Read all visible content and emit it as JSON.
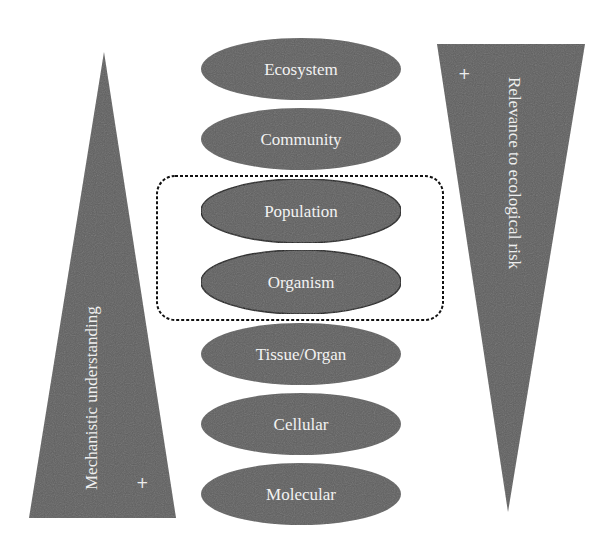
{
  "diagram": {
    "levels": [
      {
        "label": "Ecosystem",
        "highlighted": false
      },
      {
        "label": "Community",
        "highlighted": false
      },
      {
        "label": "Population",
        "highlighted": true
      },
      {
        "label": "Organism",
        "highlighted": true
      },
      {
        "label": "Tissue/Organ",
        "highlighted": false
      },
      {
        "label": "Cellular",
        "highlighted": false
      },
      {
        "label": "Molecular",
        "highlighted": false
      }
    ],
    "left_wedge": {
      "label": "Mechanistic understanding",
      "marker": "+",
      "orientation": "apex-top"
    },
    "right_wedge": {
      "label": "Relevance to ecological risk",
      "marker": "+",
      "orientation": "apex-bottom"
    },
    "highlight_box": {
      "style": "dashed rounded rectangle",
      "encloses": [
        "Population",
        "Organism"
      ]
    },
    "colors": {
      "shape_fill": "#5f5f5f",
      "text": "#f2f2f2",
      "outline": "#111111",
      "background": "#ffffff"
    }
  }
}
